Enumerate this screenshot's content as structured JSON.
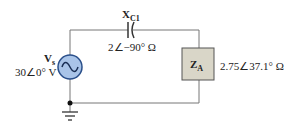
{
  "circuit": {
    "source": {
      "symbol": "V",
      "subscript": "s",
      "value": "30∠0° V",
      "fill_color": "#a9c4e8",
      "stroke_color": "#2a4f8a"
    },
    "capacitor": {
      "symbol": "X",
      "subscript": "C1",
      "value": "2∠−90° Ω"
    },
    "load": {
      "symbol": "Z",
      "subscript": "A",
      "value": "2.75∠37.1° Ω",
      "fill_color": "#d9d6c8"
    },
    "wire_color": "#777777"
  }
}
